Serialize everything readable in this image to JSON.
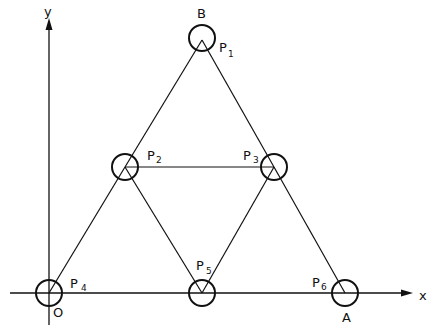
{
  "diagram": {
    "type": "truss-frame",
    "axes": {
      "x_label": "x",
      "y_label": "y",
      "origin_label": "O"
    },
    "points": [
      {
        "id": "P1",
        "base": "P",
        "sub": "1",
        "alias": "B",
        "cx": 202,
        "cy": 40
      },
      {
        "id": "P2",
        "base": "P",
        "sub": "2",
        "cx": 125,
        "cy": 167
      },
      {
        "id": "P3",
        "base": "P",
        "sub": "3",
        "cx": 274,
        "cy": 167
      },
      {
        "id": "P4",
        "base": "P",
        "sub": "4",
        "alias": "O",
        "cx": 49,
        "cy": 293
      },
      {
        "id": "P5",
        "base": "P",
        "sub": "5",
        "cx": 202,
        "cy": 293
      },
      {
        "id": "P6",
        "base": "P",
        "sub": "6",
        "alias": "A",
        "cx": 345,
        "cy": 293
      }
    ],
    "members": [
      [
        "P1",
        "P2"
      ],
      [
        "P1",
        "P3"
      ],
      [
        "P2",
        "P3"
      ],
      [
        "P2",
        "P4"
      ],
      [
        "P2",
        "P5"
      ],
      [
        "P3",
        "P5"
      ],
      [
        "P3",
        "P6"
      ]
    ],
    "labels": {
      "B": "B",
      "A": "A",
      "O": "O",
      "P1_base": "P",
      "P1_sub": "1",
      "P2_base": "P",
      "P2_sub": "2",
      "P3_base": "P",
      "P3_sub": "3",
      "P4_base": "P",
      "P4_sub": "4",
      "P5_base": "P",
      "P5_sub": "5",
      "P6_base": "P",
      "P6_sub": "6"
    },
    "colors": {
      "stroke": "#111111",
      "background": "#ffffff"
    }
  }
}
